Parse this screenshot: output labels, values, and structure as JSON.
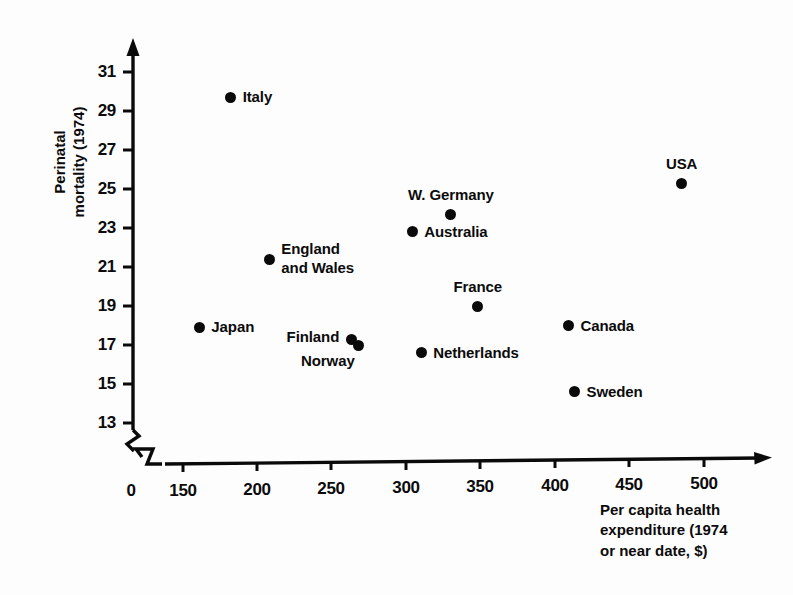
{
  "chart_data": {
    "type": "scatter",
    "title": "",
    "xlabel": "Per capita health expenditure (1974 or near date, $)",
    "ylabel": "Perinatal mortality (1974)",
    "xlabel_lines": [
      "Per capita health",
      "expenditure (1974",
      "or near date, $)"
    ],
    "ylabel_lines": [
      "Perinatal",
      "mortality (1974)"
    ],
    "xlim": [
      138,
      520
    ],
    "ylim": [
      12.2,
      31.8
    ],
    "grid": false,
    "legend": null,
    "axis_break": {
      "x_axis": true,
      "y_axis": true,
      "origin_label": "0"
    },
    "xticks": [
      150,
      200,
      250,
      300,
      350,
      400,
      450,
      500
    ],
    "xtick_labels": [
      "150",
      "200",
      "250",
      "300",
      "350",
      "400",
      "450",
      "500"
    ],
    "yticks": [
      13,
      15,
      17,
      19,
      21,
      23,
      25,
      27,
      29,
      31
    ],
    "ytick_labels": [
      "13",
      "15",
      "17",
      "19",
      "21",
      "23",
      "25",
      "27",
      "29",
      "31"
    ],
    "origin_tick_label": "0",
    "points": [
      {
        "label": "Italy",
        "x": 182,
        "y": 29.7,
        "label_pos": "right"
      },
      {
        "label": "USA",
        "x": 485,
        "y": 25.3,
        "label_pos": "above"
      },
      {
        "label": "W. Germany",
        "x": 330,
        "y": 23.7,
        "label_pos": "above"
      },
      {
        "label": "Australia",
        "x": 304,
        "y": 22.8,
        "label_pos": "right"
      },
      {
        "label": "England\nand Wales",
        "x": 208,
        "y": 21.4,
        "label_pos": "right"
      },
      {
        "label": "France",
        "x": 348,
        "y": 19.0,
        "label_pos": "above"
      },
      {
        "label": "Canada",
        "x": 409,
        "y": 18.0,
        "label_pos": "right"
      },
      {
        "label": "Japan",
        "x": 161,
        "y": 17.9,
        "label_pos": "right"
      },
      {
        "label": "Finland",
        "x": 263,
        "y": 17.3,
        "label_pos": "left"
      },
      {
        "label": "Norway",
        "x": 268,
        "y": 17.0,
        "label_pos": "below-left"
      },
      {
        "label": "Netherlands",
        "x": 310,
        "y": 16.6,
        "label_pos": "right"
      },
      {
        "label": "Sweden",
        "x": 413,
        "y": 14.6,
        "label_pos": "right"
      }
    ]
  },
  "colors": {
    "marker": "#0a0a0a",
    "axis": "#0a0a0a",
    "text": "#0b0b0b",
    "background": "#fdfdfd"
  }
}
